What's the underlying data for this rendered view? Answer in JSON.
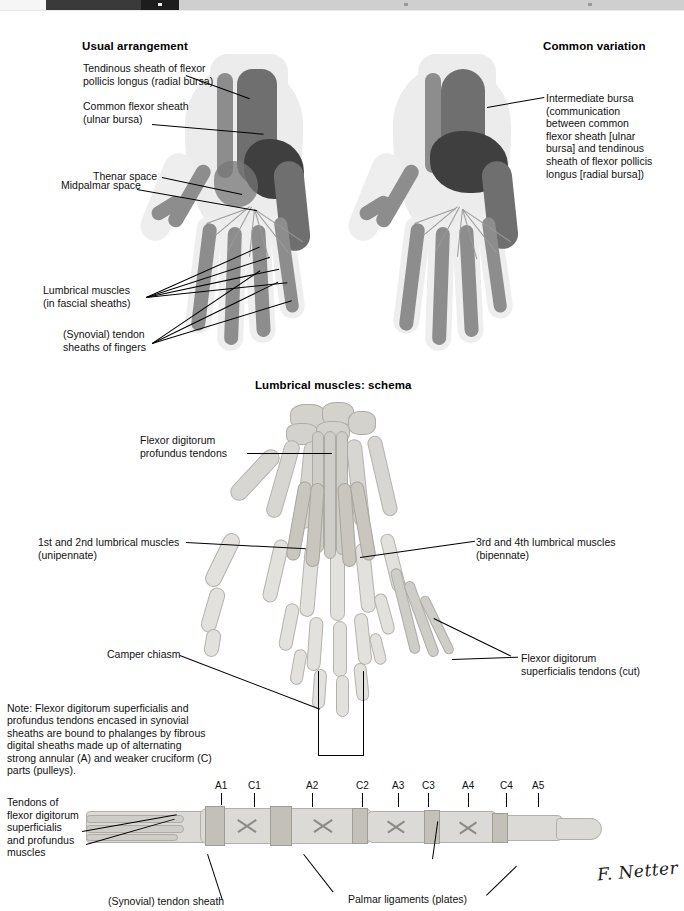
{
  "viewer": {
    "chrome_visible": true
  },
  "plate": {
    "signature": "F. Netter",
    "panels": {
      "top": {
        "left_title": "Usual arrangement",
        "right_title": "Common variation",
        "labels": {
          "tendinous_sheath": "Tendinous sheath of flexor\npollicis longus (radial bursa)",
          "common_flexor_sheath": "Common flexor sheath\n(ulnar bursa)",
          "thenar_space": "Thenar space",
          "midpalmar_space": "Midpalmar space",
          "lumbrical_muscles": "Lumbrical muscles\n(in fascial sheaths)",
          "synovial_sheaths_fingers": "(Synovial) tendon\nsheaths of fingers",
          "intermediate_bursa": "Intermediate bursa\n(communication\nbetween common\nflexor sheath [ulnar\nbursa] and tendinous\nsheath of flexor pollicis\nlongus [radial bursa])"
        }
      },
      "middle": {
        "title": "Lumbrical muscles: schema",
        "labels": {
          "fdp_tendons": "Flexor digitorum\nprofundus tendons",
          "lumbrical_1_2": "1st and 2nd lumbrical muscles\n(unipennate)",
          "lumbrical_3_4": "3rd and 4th lumbrical muscles\n(bipennate)",
          "camper_chiasm": "Camper chiasm",
          "fds_tendons_cut": "Flexor digitorum\nsuperficialis tendons (cut)"
        }
      },
      "note": {
        "text": "Note: Flexor digitorum superficialis and profundus tendons encased in synovial sheaths are bound to phalanges by fibrous digital sheaths made up of alternating strong annular (A) and weaker cruciform (C) parts (pulleys)."
      },
      "bottom": {
        "pulleys": [
          "A1",
          "C1",
          "A2",
          "C2",
          "A3",
          "C3",
          "A4",
          "C4",
          "A5"
        ],
        "labels": {
          "tendons_left": "Tendons of\nflexor digitorum\nsuperficialis\nand profundus\nmuscles",
          "synovial_tendon_sheath": "(Synovial) tendon sheath",
          "palmar_ligaments": "Palmar ligaments (plates)"
        }
      }
    },
    "colors": {
      "background": "#ffffff",
      "text": "#111111",
      "skin_wash": "#ececec",
      "sheath_mid": "#8d8d8d",
      "sheath_dark": "#3f3f3f",
      "bone": "#d8d6d2"
    }
  }
}
